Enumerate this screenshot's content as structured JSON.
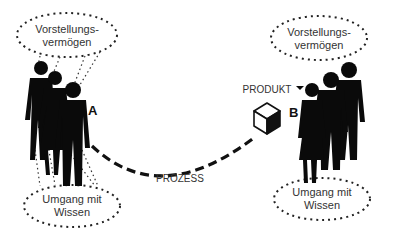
{
  "diagram": {
    "left_group": {
      "label": "A",
      "top_bubble": {
        "line1": "Vorstellungs-",
        "line2": "vermögen"
      },
      "bottom_bubble": {
        "line1": "Umgang mit",
        "line2": "Wissen"
      },
      "figure_count": 3
    },
    "right_group": {
      "label": "B",
      "top_bubble": {
        "line1": "Vorstellungs-",
        "line2": "vermögen"
      },
      "bottom_bubble": {
        "line1": "Umgang mit",
        "line2": "Wissen"
      },
      "figure_count": 3
    },
    "product_label": "PRODUKT",
    "process_label": "PROZESS",
    "product_icon": "cube-icon",
    "colors": {
      "ink": "#111111",
      "text": "#333333",
      "background": "#ffffff"
    }
  }
}
